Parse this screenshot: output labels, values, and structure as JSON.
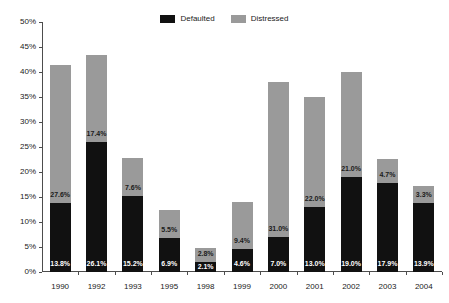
{
  "chart_data": {
    "type": "bar",
    "stacked": true,
    "title": "",
    "xlabel": "",
    "ylabel": "",
    "ylim": [
      0,
      50
    ],
    "ytick_labels": [
      "0%",
      "5%",
      "10%",
      "15%",
      "20%",
      "25%",
      "30%",
      "35%",
      "40%",
      "45%",
      "50%"
    ],
    "ytick_values": [
      0,
      5,
      10,
      15,
      20,
      25,
      30,
      35,
      40,
      45,
      50
    ],
    "grid": false,
    "legend_position": "top-center",
    "categories": [
      "1990",
      "1992",
      "1993",
      "1995",
      "1998",
      "1999",
      "2000",
      "2001",
      "2002",
      "2003",
      "2004"
    ],
    "series": [
      {
        "name": "Defaulted",
        "color": "#111111",
        "values": [
          13.8,
          26.1,
          15.2,
          6.9,
          2.1,
          4.6,
          7.0,
          13.0,
          19.0,
          17.9,
          13.9
        ],
        "labels": [
          "13.8%",
          "26.1%",
          "15.2%",
          "6.9%",
          "2.1%",
          "4.6%",
          "7.0%",
          "13.0%",
          "19.0%",
          "17.9%",
          "13.9%"
        ]
      },
      {
        "name": "Distressed",
        "color": "#9a9a9a",
        "values": [
          27.6,
          17.4,
          7.6,
          5.5,
          2.8,
          9.4,
          31.0,
          22.0,
          21.0,
          4.7,
          3.3
        ],
        "labels": [
          "27.6%",
          "17.4%",
          "7.6%",
          "5.5%",
          "2.8%",
          "9.4%",
          "31.0%",
          "22.0%",
          "21.0%",
          "4.7%",
          "3.3%"
        ]
      }
    ],
    "totals": [
      41.4,
      43.5,
      22.8,
      12.4,
      4.9,
      14.0,
      38.0,
      35.0,
      40.0,
      22.6,
      17.2
    ]
  },
  "legend": {
    "entries": [
      {
        "label": "Defaulted",
        "color": "#111111"
      },
      {
        "label": "Distressed",
        "color": "#9a9a9a"
      }
    ]
  }
}
